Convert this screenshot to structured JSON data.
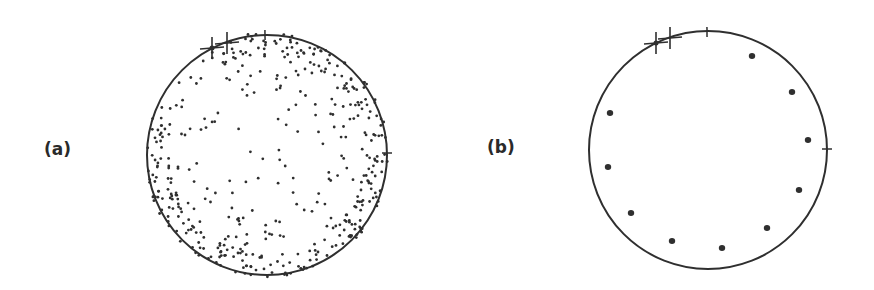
{
  "panels": [
    {
      "label": "(a)",
      "description": "Stereographic projection with many scattered points, concentrated near the circle perimeter",
      "circle": {
        "cx": 267,
        "cy": 155,
        "r": 120
      },
      "ticks": [
        {
          "x": 265,
          "y": 35
        },
        {
          "x": 387,
          "y": 153
        }
      ],
      "markers": [
        {
          "x": 212,
          "y": 48
        },
        {
          "x": 227,
          "y": 43
        }
      ],
      "point_count_approx": 500
    },
    {
      "label": "(b)",
      "description": "Stereographic projection with ten evenly spaced points near the circle perimeter",
      "circle": {
        "cx": 708,
        "cy": 150,
        "r": 119
      },
      "ticks": [
        {
          "x": 707,
          "y": 32
        },
        {
          "x": 827,
          "y": 149
        }
      ],
      "markers": [
        {
          "x": 656,
          "y": 43
        },
        {
          "x": 670,
          "y": 38
        }
      ],
      "points": [
        {
          "x": 752,
          "y": 56
        },
        {
          "x": 792,
          "y": 92
        },
        {
          "x": 808,
          "y": 140
        },
        {
          "x": 799,
          "y": 190
        },
        {
          "x": 767,
          "y": 228
        },
        {
          "x": 722,
          "y": 248
        },
        {
          "x": 672,
          "y": 241
        },
        {
          "x": 631,
          "y": 213
        },
        {
          "x": 608,
          "y": 167
        },
        {
          "x": 610,
          "y": 113
        }
      ]
    }
  ],
  "colors": {
    "ink": "#2f2f2f",
    "background": "#ffffff"
  }
}
